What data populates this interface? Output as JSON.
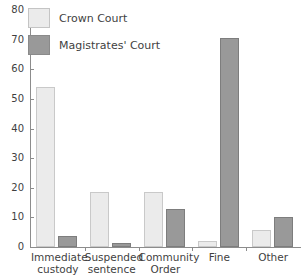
{
  "chart_data": {
    "type": "bar",
    "title": "",
    "xlabel": "",
    "ylabel": "",
    "ylim": [
      0,
      80
    ],
    "grid": false,
    "legend_position": "top-left",
    "categories": [
      "Immediate custody",
      "Suspended sentence",
      "Community Order",
      "Fine",
      "Other"
    ],
    "series": [
      {
        "name": "Crown Court",
        "color": "#ebebeb",
        "values": [
          54,
          18.5,
          18.5,
          2,
          5.8
        ]
      },
      {
        "name": "Magistrates' Court",
        "color": "#999999",
        "values": [
          3.7,
          1.5,
          13,
          70.5,
          10
        ]
      }
    ],
    "yticks": [
      0,
      10,
      20,
      30,
      40,
      50,
      60,
      70,
      80
    ],
    "ytick_labels": [
      "0",
      "10",
      "20",
      "30",
      "40",
      "50",
      "60",
      "70",
      "80"
    ]
  },
  "legend": {
    "items": [
      {
        "label": "Crown Court"
      },
      {
        "label": "Magistrates' Court"
      }
    ]
  },
  "axis": {
    "color": "#8c8c8c"
  }
}
